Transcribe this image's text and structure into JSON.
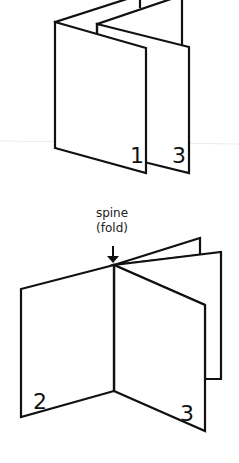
{
  "diagram": {
    "top_figure": {
      "description": "accordion-folded sheet",
      "page_labels": [
        "1",
        "3"
      ]
    },
    "bottom_figure": {
      "description": "open booklet with spine",
      "annotation": {
        "line1": "spine",
        "line2": "(fold)",
        "arrow": "down-arrow-icon"
      },
      "page_labels": [
        "2",
        "3"
      ]
    },
    "colors": {
      "stroke": "#111111",
      "background": "#ffffff",
      "divider": "#ececec"
    }
  }
}
